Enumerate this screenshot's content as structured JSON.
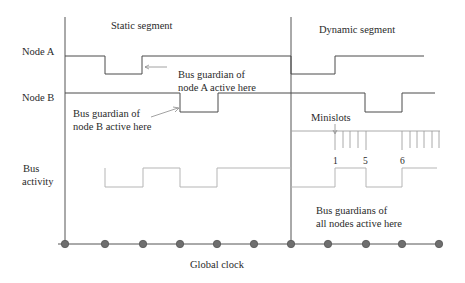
{
  "segments": {
    "static_label": "Static segment",
    "dynamic_label": "Dynamic segment"
  },
  "rows": {
    "node_a": "Node A",
    "node_b": "Node B",
    "bus_line1": "Bus",
    "bus_line2": "activity"
  },
  "annotations": {
    "guardian_a_line1": "Bus guardian of",
    "guardian_a_line2": "node A active here",
    "guardian_b_line1": "Bus guardian of",
    "guardian_b_line2": "node B active here",
    "minislots": "Minislots",
    "all_line1": "Bus guardians of",
    "all_line2": "all nodes active here"
  },
  "minislot_numbers": [
    "1",
    "5",
    "6"
  ],
  "axis": {
    "label": "Global clock",
    "tick_count": 11
  },
  "colors": {
    "signal": "#4a4a4a",
    "bus": "#b5b5b5",
    "dot": "#6e6e6e"
  }
}
